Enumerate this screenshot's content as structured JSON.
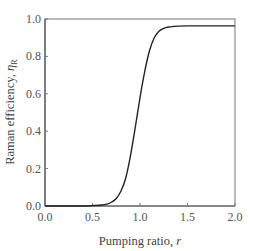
{
  "chart_data": {
    "type": "line",
    "title": "",
    "xlabel": "Pumping ratio, r",
    "xlabel_parts": {
      "text": "Pumping ratio, ",
      "var": "r"
    },
    "ylabel": "Raman efficiency, ηR",
    "ylabel_parts": {
      "text": "Raman efficiency, ",
      "var": "η",
      "sub": "R"
    },
    "xlim": [
      0.0,
      2.0
    ],
    "ylim": [
      0.0,
      1.0
    ],
    "xticks": [
      "0.0",
      "0.5",
      "1.0",
      "1.5",
      "2.0"
    ],
    "yticks": [
      "0.0",
      "0.2",
      "0.4",
      "0.6",
      "0.8",
      "1.0"
    ],
    "grid": false,
    "legend": null,
    "series": [
      {
        "name": "Raman efficiency",
        "x": [
          0.0,
          0.2,
          0.4,
          0.5,
          0.6,
          0.65,
          0.7,
          0.75,
          0.8,
          0.85,
          0.9,
          0.95,
          1.0,
          1.05,
          1.1,
          1.15,
          1.2,
          1.25,
          1.3,
          1.35,
          1.4,
          1.5,
          1.6,
          1.8,
          2.0
        ],
        "values": [
          0.0,
          0.0,
          0.0,
          0.002,
          0.005,
          0.01,
          0.02,
          0.04,
          0.08,
          0.15,
          0.27,
          0.42,
          0.58,
          0.72,
          0.83,
          0.9,
          0.935,
          0.95,
          0.957,
          0.96,
          0.962,
          0.963,
          0.963,
          0.963,
          0.963
        ]
      }
    ]
  },
  "colors": {
    "line": "#222222",
    "axes": "#777777",
    "background": "#ffffff"
  }
}
